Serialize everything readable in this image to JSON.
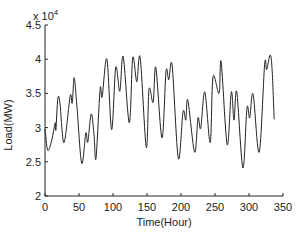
{
  "chart_data": {
    "type": "line",
    "title": "",
    "xlabel": "Time(Hour)",
    "ylabel": "Load(MW)",
    "y_multiplier_label": "x 10",
    "y_multiplier_exponent": "4",
    "xlim": [
      0,
      350
    ],
    "ylim": [
      2,
      4.5
    ],
    "x_ticks": [
      0,
      50,
      100,
      150,
      200,
      250,
      300,
      350
    ],
    "y_ticks": [
      2,
      2.5,
      3,
      3.5,
      4,
      4.5
    ],
    "y_tick_labels": [
      "2",
      "2.5",
      "3",
      "3.5",
      "4",
      "4.5"
    ],
    "grid": false,
    "legend": null,
    "line_color": "#222222",
    "series": [
      {
        "name": "Load",
        "points": [
          [
            0,
            2.98
          ],
          [
            4,
            2.67
          ],
          [
            10,
            2.82
          ],
          [
            15,
            3.07
          ],
          [
            16,
            2.97
          ],
          [
            19,
            3.43
          ],
          [
            22,
            3.35
          ],
          [
            28,
            2.78
          ],
          [
            37,
            3.46
          ],
          [
            40,
            3.36
          ],
          [
            43,
            3.73
          ],
          [
            47,
            3.3
          ],
          [
            54,
            2.48
          ],
          [
            60,
            2.92
          ],
          [
            63,
            2.79
          ],
          [
            68,
            3.2
          ],
          [
            72,
            2.9
          ],
          [
            75,
            2.55
          ],
          [
            81,
            3.56
          ],
          [
            84,
            3.45
          ],
          [
            91,
            4.0
          ],
          [
            98,
            2.97
          ],
          [
            104,
            3.88
          ],
          [
            110,
            3.53
          ],
          [
            115,
            4.04
          ],
          [
            124,
            3.07
          ],
          [
            129,
            4.02
          ],
          [
            135,
            3.67
          ],
          [
            140,
            4.02
          ],
          [
            149,
            2.71
          ],
          [
            153,
            3.56
          ],
          [
            159,
            3.37
          ],
          [
            163,
            3.88
          ],
          [
            172,
            2.85
          ],
          [
            178,
            3.82
          ],
          [
            182,
            3.7
          ],
          [
            187,
            3.9
          ],
          [
            196,
            2.55
          ],
          [
            203,
            3.23
          ],
          [
            207,
            3.11
          ],
          [
            210,
            3.4
          ],
          [
            220,
            2.64
          ],
          [
            225,
            3.14
          ],
          [
            229,
            2.99
          ],
          [
            235,
            3.52
          ],
          [
            243,
            2.78
          ],
          [
            247,
            3.74
          ],
          [
            256,
            3.5
          ],
          [
            259,
            3.96
          ],
          [
            268,
            2.75
          ],
          [
            274,
            3.52
          ],
          [
            278,
            3.11
          ],
          [
            282,
            3.52
          ],
          [
            291,
            2.41
          ],
          [
            297,
            3.29
          ],
          [
            301,
            3.14
          ],
          [
            306,
            3.49
          ],
          [
            315,
            2.64
          ],
          [
            323,
            3.92
          ],
          [
            326,
            3.85
          ],
          [
            331,
            4.06
          ],
          [
            334,
            3.85
          ],
          [
            337,
            3.12
          ]
        ]
      }
    ]
  }
}
